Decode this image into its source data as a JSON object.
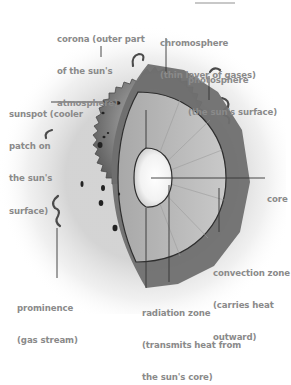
{
  "diagram": {
    "labels": {
      "corona": [
        "corona (outer part",
        "of the sun's",
        "atmosphere)"
      ],
      "chromosphere": [
        "chromosphere",
        "(thin layer of gases)"
      ],
      "photosphere": [
        "photosphere",
        "(the sun's surface)"
      ],
      "sunspot": [
        "sunspot (cooler",
        "patch on",
        "the sun's",
        "surface)"
      ],
      "core": [
        "core"
      ],
      "convection_zone": [
        "convection zone",
        "(carries heat",
        "outward)"
      ],
      "prominence": [
        "prominence",
        "(gas stream)"
      ],
      "radiation_zone": [
        "radiation zone",
        "(transmits heat from",
        "the sun's core)"
      ]
    },
    "colors": {
      "label_text": "#8a8a8a",
      "leader_line": "#333333",
      "sun_surface": "#7a7a7a",
      "sun_dark": "#555555",
      "core": "#ffffff",
      "glow": "#d8d8d8"
    }
  }
}
